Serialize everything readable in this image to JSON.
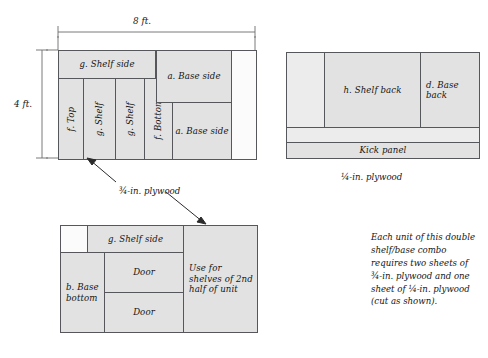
{
  "diagram": {
    "title_dimensions": {
      "width_label": "8 ft.",
      "height_label": "4 ft."
    },
    "sheets": [
      {
        "id": "sheet-1",
        "material_label": "¾-in. plywood",
        "parts": [
          {
            "name": "shelf-side",
            "label": "g. Shelf side",
            "orientation": "horizontal"
          },
          {
            "name": "top",
            "label": "f. Top",
            "orientation": "vertical"
          },
          {
            "name": "shelf-1",
            "label": "g. Shelf",
            "orientation": "vertical"
          },
          {
            "name": "shelf-2",
            "label": "g. Shelf",
            "orientation": "vertical"
          },
          {
            "name": "bottom",
            "label": "f. Bottom",
            "orientation": "vertical"
          },
          {
            "name": "base-side-1",
            "label": "a. Base side",
            "orientation": "horizontal"
          },
          {
            "name": "base-side-2",
            "label": "a. Base side",
            "orientation": "horizontal"
          },
          {
            "name": "offcut",
            "label": "",
            "orientation": "horizontal"
          }
        ]
      },
      {
        "id": "sheet-2",
        "material_label": "¼-in. plywood",
        "parts": [
          {
            "name": "offcut-left",
            "label": "",
            "orientation": "horizontal"
          },
          {
            "name": "shelf-back",
            "label": "h. Shelf back",
            "orientation": "horizontal"
          },
          {
            "name": "base-back",
            "label": "d. Base\nback",
            "orientation": "horizontal"
          },
          {
            "name": "kick-panel",
            "label": "Kick panel",
            "orientation": "horizontal"
          }
        ]
      },
      {
        "id": "sheet-3",
        "material_label": "",
        "parts": [
          {
            "name": "corner-offcut",
            "label": "",
            "orientation": "horizontal"
          },
          {
            "name": "shelf-side",
            "label": "g. Shelf side",
            "orientation": "horizontal"
          },
          {
            "name": "base-bottom",
            "label": "b. Base\nbottom",
            "orientation": "horizontal"
          },
          {
            "name": "door-1",
            "label": "Door",
            "orientation": "horizontal"
          },
          {
            "name": "door-2",
            "label": "Door",
            "orientation": "horizontal"
          },
          {
            "name": "reserved-area",
            "label": "Use for\nshelves of\n2nd half\nof unit",
            "orientation": "horizontal"
          }
        ]
      }
    ],
    "note": "Each unit of this double\nshelf/base combo\nrequires two sheets of\n¾-in. plywood and one\nsheet of ¼-in. plywood\n(cut as shown).",
    "colors": {
      "fill": "#e2e2e2",
      "fill_light": "#ececec",
      "fill_blank": "#fbfbfb",
      "outline": "#2b2b2b",
      "inner_line": "#55575a",
      "text": "#141414"
    }
  }
}
